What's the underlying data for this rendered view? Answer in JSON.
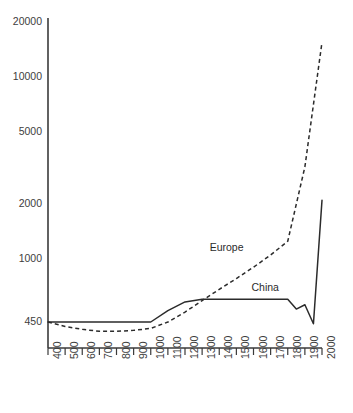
{
  "chart_data": {
    "type": "line",
    "title": "",
    "subtitle": "",
    "xlabel": "",
    "ylabel": "",
    "yscale": "log",
    "ylim": [
      380,
      22000
    ],
    "xlim": [
      400,
      2000
    ],
    "grid": false,
    "legend_position": "inline-annotation",
    "y_ticks": [
      450,
      1000,
      2000,
      5000,
      10000,
      20000
    ],
    "y_tick_labels": [
      "450",
      "1000",
      "2000",
      "5000",
      "10000",
      "20000"
    ],
    "x_ticks": [
      400,
      500,
      600,
      700,
      800,
      900,
      1000,
      1100,
      1200,
      1300,
      1400,
      1500,
      1600,
      1700,
      1800,
      1900,
      2000
    ],
    "x_tick_labels": [
      "400",
      "500",
      "600",
      "700",
      "800",
      "900",
      "1000",
      "1100",
      "1200",
      "1300",
      "1400",
      "1500",
      "1600",
      "1700",
      "1800",
      "1900",
      "2000"
    ],
    "series": [
      {
        "name": "Europe",
        "style": "dashed",
        "label_text": "Europe",
        "x": [
          400,
          500,
          600,
          700,
          800,
          900,
          1000,
          1100,
          1200,
          1300,
          1400,
          1500,
          1600,
          1700,
          1800,
          1900,
          2000
        ],
        "values": [
          450,
          425,
          410,
          400,
          400,
          405,
          415,
          450,
          510,
          590,
          680,
          780,
          900,
          1050,
          1250,
          3200,
          15500
        ]
      },
      {
        "name": "China",
        "style": "solid",
        "label_text": "China",
        "x": [
          400,
          500,
          600,
          700,
          800,
          900,
          1000,
          1100,
          1200,
          1300,
          1400,
          1500,
          1600,
          1700,
          1800,
          1850,
          1900,
          1950,
          2000
        ],
        "values": [
          450,
          450,
          450,
          450,
          450,
          450,
          450,
          520,
          580,
          600,
          600,
          600,
          600,
          600,
          600,
          530,
          560,
          440,
          2100
        ]
      }
    ],
    "annotations": [
      {
        "text": "Europe",
        "x": 1560,
        "y": 1150
      },
      {
        "text": "China",
        "x": 1740,
        "y": 690
      }
    ]
  },
  "colors": {
    "axis": "#3a3a3a",
    "series_line": "#2b2b2b",
    "background": "#ffffff",
    "tick_text": "#3d3d3d"
  }
}
